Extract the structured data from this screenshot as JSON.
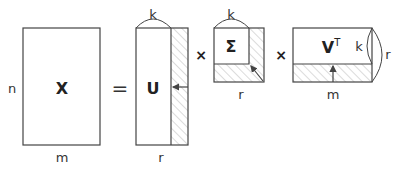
{
  "diagram": {
    "colors": {
      "stroke": "#444444",
      "hatch": "#b0b0b0",
      "text": "#333333"
    },
    "matrix_x": {
      "label": "X",
      "rows_label": "n",
      "cols_label": "m"
    },
    "equals": "=",
    "matrix_u": {
      "label": "U",
      "top_label": "k",
      "bottom_label": "r"
    },
    "times_1": "×",
    "matrix_sigma": {
      "label": "Σ",
      "top_label": "k",
      "bottom_label": "r"
    },
    "times_2": "×",
    "matrix_vt": {
      "label": "V",
      "superscript": "T",
      "inner_label": "k",
      "outer_label": "r",
      "bottom_label": "m"
    }
  }
}
